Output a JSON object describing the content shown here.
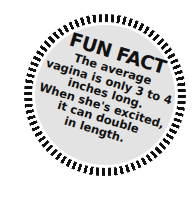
{
  "badge": {
    "title": "FUN FACT",
    "lines": [
      "The average",
      "vagina is only 3 to 4",
      "inches long.",
      "When she's excited,",
      "it can double",
      "in length."
    ],
    "colors": {
      "stripes": "#111111",
      "disc": "#e3e3e3",
      "text": "#111111"
    }
  }
}
